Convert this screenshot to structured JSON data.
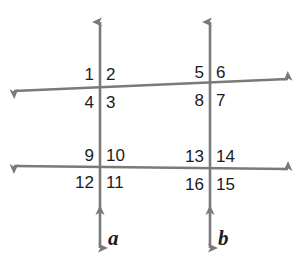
{
  "figure": {
    "type": "geometry-diagram",
    "background_color": "#ffffff",
    "line_color": "#7a7a7a",
    "label_color": "#1c1c1c"
  },
  "lines": {
    "vertical": [
      {
        "name": "a",
        "label": "a",
        "x": 100,
        "y_top": 22,
        "y_bottom": 248
      },
      {
        "name": "b",
        "label": "b",
        "x": 210,
        "y_top": 22,
        "y_bottom": 248
      }
    ],
    "horizontal": [
      {
        "name": "upper-transversal",
        "x_left": 14,
        "y_left": 91,
        "x_right": 288,
        "y_right": 79
      },
      {
        "name": "lower-transversal",
        "x_left": 14,
        "y_left": 166,
        "x_right": 288,
        "y_right": 169
      }
    ]
  },
  "intersections": [
    {
      "name": "top-left",
      "line": "a",
      "transversal": "upper-transversal",
      "angles": {
        "upper_left": "1",
        "upper_right": "2",
        "lower_right": "3",
        "lower_left": "4"
      }
    },
    {
      "name": "top-right",
      "line": "b",
      "transversal": "upper-transversal",
      "angles": {
        "upper_left": "5",
        "upper_right": "6",
        "lower_right": "7",
        "lower_left": "8"
      }
    },
    {
      "name": "bottom-left",
      "line": "a",
      "transversal": "lower-transversal",
      "angles": {
        "upper_left": "9",
        "upper_right": "10",
        "lower_right": "11",
        "lower_left": "12"
      }
    },
    {
      "name": "bottom-right",
      "line": "b",
      "transversal": "lower-transversal",
      "angles": {
        "upper_left": "13",
        "upper_right": "14",
        "lower_right": "15",
        "lower_left": "16"
      }
    }
  ],
  "angle_labels": [
    {
      "id": "angle-1",
      "text": "1",
      "x": 94,
      "y": 66,
      "align": "right"
    },
    {
      "id": "angle-2",
      "text": "2",
      "x": 106,
      "y": 66,
      "align": "left"
    },
    {
      "id": "angle-4",
      "text": "4",
      "x": 94,
      "y": 94,
      "align": "right"
    },
    {
      "id": "angle-3",
      "text": "3",
      "x": 106,
      "y": 94,
      "align": "left"
    },
    {
      "id": "angle-5",
      "text": "5",
      "x": 204,
      "y": 64,
      "align": "right"
    },
    {
      "id": "angle-6",
      "text": "6",
      "x": 216,
      "y": 64,
      "align": "left"
    },
    {
      "id": "angle-8",
      "text": "8",
      "x": 204,
      "y": 92,
      "align": "right"
    },
    {
      "id": "angle-7",
      "text": "7",
      "x": 216,
      "y": 92,
      "align": "left"
    },
    {
      "id": "angle-9",
      "text": "9",
      "x": 94,
      "y": 147,
      "align": "right"
    },
    {
      "id": "angle-10",
      "text": "10",
      "x": 106,
      "y": 147,
      "align": "left"
    },
    {
      "id": "angle-12",
      "text": "12",
      "x": 94,
      "y": 174,
      "align": "right"
    },
    {
      "id": "angle-11",
      "text": "11",
      "x": 106,
      "y": 174,
      "align": "left"
    },
    {
      "id": "angle-13",
      "text": "13",
      "x": 204,
      "y": 148,
      "align": "right"
    },
    {
      "id": "angle-14",
      "text": "14",
      "x": 216,
      "y": 148,
      "align": "left"
    },
    {
      "id": "angle-16",
      "text": "16",
      "x": 204,
      "y": 176,
      "align": "right"
    },
    {
      "id": "angle-15",
      "text": "15",
      "x": 216,
      "y": 176,
      "align": "left"
    }
  ],
  "line_name_labels": [
    {
      "id": "line-label-a",
      "text": "a",
      "x": 108,
      "y": 228
    },
    {
      "id": "line-label-b",
      "text": "b",
      "x": 218,
      "y": 228
    }
  ]
}
